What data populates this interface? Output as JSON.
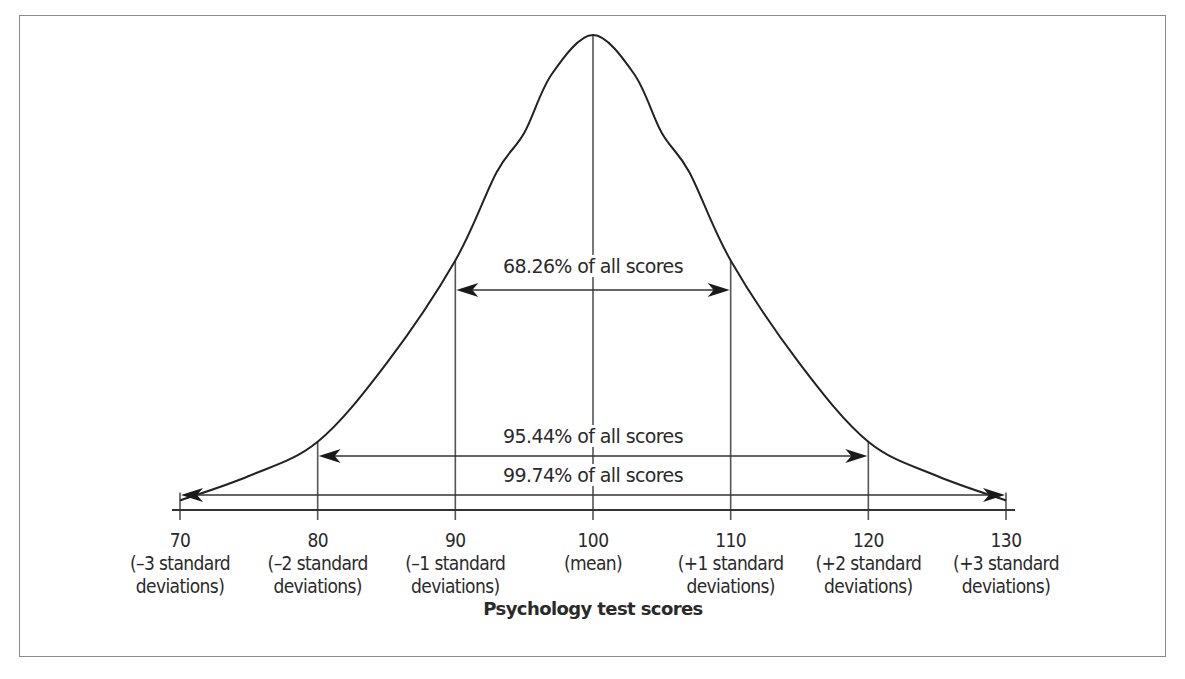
{
  "chart_data": {
    "type": "line",
    "title": "",
    "xlabel": "Psychology test scores",
    "ylabel": "",
    "distribution": "normal",
    "mean": 100,
    "standard_deviation": 10,
    "x_ticks": [
      {
        "value": 70,
        "line1": "70",
        "line2": "(–3 standard",
        "line3": "deviations)"
      },
      {
        "value": 80,
        "line1": "80",
        "line2": "(–2 standard",
        "line3": "deviations)"
      },
      {
        "value": 90,
        "line1": "90",
        "line2": "(–1 standard",
        "line3": "deviations)"
      },
      {
        "value": 100,
        "line1": "100",
        "line2": "(mean)",
        "line3": ""
      },
      {
        "value": 110,
        "line1": "110",
        "line2": "(+1 standard",
        "line3": "deviations)"
      },
      {
        "value": 120,
        "line1": "120",
        "line2": "(+2 standard",
        "line3": "deviations)"
      },
      {
        "value": 130,
        "line1": "130",
        "line2": "(+3 standard",
        "line3": "deviations)"
      }
    ],
    "xlim": [
      70,
      130
    ],
    "curve_points_relative_height": [
      {
        "x": 70,
        "h": 0.05
      },
      {
        "x": 75,
        "h": 0.1
      },
      {
        "x": 80,
        "h": 0.17
      },
      {
        "x": 85,
        "h": 0.33
      },
      {
        "x": 90,
        "h": 0.54
      },
      {
        "x": 93,
        "h": 0.72
      },
      {
        "x": 95,
        "h": 0.8
      },
      {
        "x": 97,
        "h": 0.92
      },
      {
        "x": 100,
        "h": 1.0
      },
      {
        "x": 103,
        "h": 0.92
      },
      {
        "x": 105,
        "h": 0.8
      },
      {
        "x": 107,
        "h": 0.72
      },
      {
        "x": 110,
        "h": 0.54
      },
      {
        "x": 115,
        "h": 0.33
      },
      {
        "x": 120,
        "h": 0.17
      },
      {
        "x": 125,
        "h": 0.1
      },
      {
        "x": 130,
        "h": 0.05
      }
    ],
    "annotations": [
      {
        "label": "68.26% of all scores",
        "from": 90,
        "to": 110
      },
      {
        "label": "95.44% of all scores",
        "from": 80,
        "to": 120
      },
      {
        "label": "99.74% of all scores",
        "from": 70,
        "to": 130
      }
    ],
    "grid": false,
    "legend": "none"
  },
  "style": {
    "curve_color": "#222222",
    "line_color": "#555555",
    "frame_color": "#8a8a8a"
  }
}
